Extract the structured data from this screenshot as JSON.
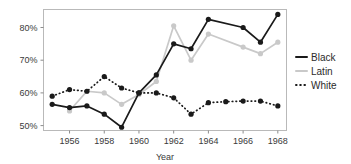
{
  "chart_data": {
    "type": "line",
    "title": "",
    "xlabel": "Year",
    "ylabel": "",
    "x": [
      1955,
      1956,
      1957,
      1958,
      1959,
      1960,
      1961,
      1962,
      1963,
      1964,
      1965,
      1966,
      1967,
      1968
    ],
    "xlim": [
      1954.5,
      1968.5
    ],
    "ylim": [
      48.5,
      85.5
    ],
    "ytick_values": [
      50,
      60,
      70,
      80
    ],
    "ytick_labels": [
      "50%",
      "60%",
      "70%",
      "80%"
    ],
    "xtick_values": [
      1956,
      1958,
      1960,
      1962,
      1964,
      1966,
      1968
    ],
    "xtick_labels": [
      "1956",
      "1958",
      "1960",
      "1962",
      "1964",
      "1966",
      "1968"
    ],
    "grid": false,
    "legend_position": "right",
    "units": "percent",
    "series": [
      {
        "name": "Black",
        "color": "#1a1a1a",
        "linestyle": "solid",
        "marker": "circle",
        "x": [
          1955,
          1956,
          1957,
          1958,
          1959,
          1960,
          1961,
          1962,
          1963,
          1964,
          1966,
          1967,
          1968
        ],
        "values": [
          56.5,
          55.5,
          56.0,
          53.5,
          49.5,
          60.0,
          65.5,
          75.0,
          73.5,
          82.5,
          80.0,
          75.5,
          84.0
        ]
      },
      {
        "name": "Latin",
        "color": "#c9c9c9",
        "linestyle": "solid",
        "marker": "circle",
        "x": [
          1956,
          1957,
          1958,
          1959,
          1960,
          1961,
          1962,
          1963,
          1964,
          1966,
          1967,
          1968
        ],
        "values": [
          54.5,
          60.5,
          60.0,
          56.5,
          59.5,
          63.5,
          80.5,
          70.0,
          78.0,
          74.0,
          72.0,
          75.5
        ]
      },
      {
        "name": "White",
        "color": "#1a1a1a",
        "linestyle": "dotted",
        "marker": "circle",
        "x": [
          1955,
          1956,
          1957,
          1958,
          1959,
          1960,
          1961,
          1962,
          1963,
          1964,
          1965,
          1966,
          1967,
          1968
        ],
        "values": [
          59.0,
          61.0,
          60.5,
          65.0,
          61.5,
          60.0,
          60.0,
          58.5,
          53.5,
          57.0,
          57.3,
          57.5,
          57.5,
          56.0
        ]
      }
    ],
    "legend": [
      {
        "label": "Black",
        "color": "#1a1a1a",
        "linestyle": "solid"
      },
      {
        "label": "Latin",
        "color": "#c9c9c9",
        "linestyle": "solid"
      },
      {
        "label": "White",
        "color": "#1a1a1a",
        "linestyle": "dotted"
      }
    ]
  }
}
